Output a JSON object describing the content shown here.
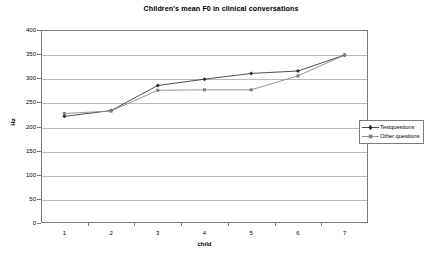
{
  "chart_data": {
    "type": "line",
    "title": "Children's mean F0 in clinical conversations",
    "xlabel": "child",
    "ylabel": "Hz",
    "categories": [
      "1",
      "2",
      "3",
      "4",
      "5",
      "6",
      "7"
    ],
    "x": [
      1,
      2,
      3,
      4,
      5,
      6,
      7
    ],
    "ylim": [
      0,
      400
    ],
    "yticks": [
      0,
      50,
      100,
      150,
      200,
      250,
      300,
      350,
      400
    ],
    "grid": true,
    "legend_position": "right",
    "series": [
      {
        "name": "Testquestions",
        "values": [
          221,
          233,
          285,
          298,
          310,
          315,
          348
        ],
        "color": "#3a3a3a",
        "marker": "diamond"
      },
      {
        "name": "Other questions",
        "values": [
          227,
          232,
          275,
          276,
          276,
          305,
          348
        ],
        "color": "#8a8a8a",
        "marker": "square"
      }
    ]
  },
  "legend": {
    "items": [
      {
        "label": "Testquestions"
      },
      {
        "label": "Other questions"
      }
    ]
  },
  "colors": {
    "axis": "#7b7b7b",
    "grid": "#b9b9b9",
    "series1": "#3a3a3a",
    "series2": "#8a8a8a",
    "background": "#ffffff",
    "text": "#000000"
  }
}
